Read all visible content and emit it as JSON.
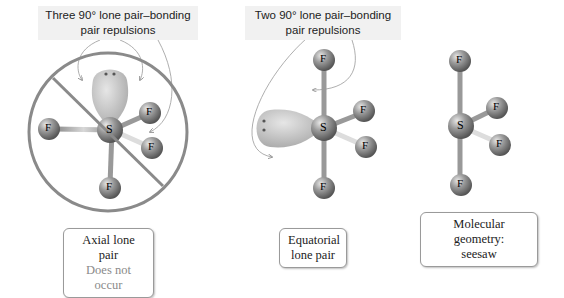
{
  "panels": [
    {
      "id": "axial",
      "caption_line1": "Three 90° lone pair–bonding",
      "caption_line2": "pair repulsions",
      "label_line1": "Axial lone pair",
      "label_line2": "Does not occur",
      "central_atom": "S",
      "ligands": [
        "F",
        "F",
        "F",
        "F"
      ]
    },
    {
      "id": "equatorial",
      "caption_line1": "Two 90° lone pair–bonding",
      "caption_line2": "pair repulsions",
      "label_line1": "Equatorial",
      "label_line2": "lone pair",
      "central_atom": "S",
      "ligands": [
        "F",
        "F",
        "F",
        "F"
      ]
    },
    {
      "id": "geometry",
      "label_line1": "Molecular geometry:",
      "label_line2": "seesaw",
      "central_atom": "S",
      "ligands": [
        "F",
        "F",
        "F",
        "F"
      ]
    }
  ],
  "colors": {
    "prohibition": "#8a8a8a",
    "atom": "#8c8c8c",
    "lone_pair": "#c9c9c9",
    "caption_bg": "#f1f1f1"
  }
}
